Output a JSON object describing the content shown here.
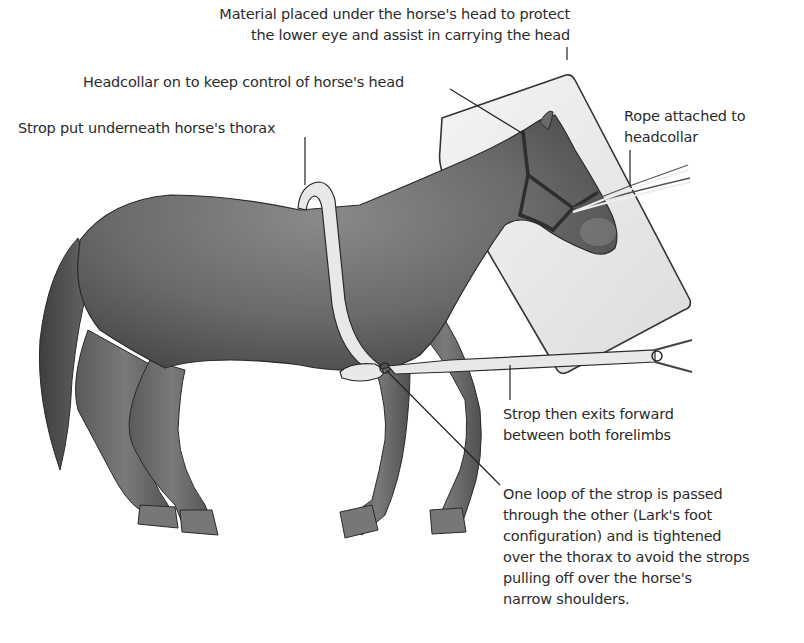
{
  "diagram": {
    "annotations": [
      {
        "id": "head-pad",
        "lines": [
          "Material placed under the horse's head to protect",
          "the lower eye and assist in carrying the head"
        ]
      },
      {
        "id": "headcollar",
        "lines": [
          "Headcollar on to keep control of horse's head"
        ]
      },
      {
        "id": "strop-under-thorax",
        "lines": [
          "Strop put underneath horse's thorax"
        ]
      },
      {
        "id": "rope",
        "lines": [
          "Rope attached to",
          "headcollar"
        ]
      },
      {
        "id": "strop-exit",
        "lines": [
          "Strop then exits forward",
          "between both forelimbs"
        ]
      },
      {
        "id": "larks-foot",
        "lines": [
          "One loop of the strop is passed",
          "through the other (Lark's foot",
          "configuration) and is tightened",
          "over the thorax to avoid the strops",
          "pulling off over the horse's",
          "narrow shoulders."
        ]
      }
    ],
    "colors": {
      "horse_body": "#6e6e6e",
      "horse_shadow": "#4a4a4a",
      "strop": "#e6e6e6",
      "pad": "#ececec",
      "headcollar": "#2e2e2e",
      "leader_line": "#222222",
      "text": "#2b2b2b"
    }
  }
}
